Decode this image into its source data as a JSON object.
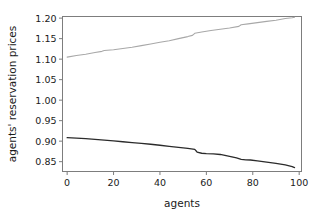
{
  "chart_data": {
    "type": "line",
    "title": "",
    "subtitle": "",
    "xlabel": "agents",
    "ylabel": "agents' reservation prices",
    "xlim": [
      -2,
      101
    ],
    "ylim": [
      0.826,
      1.204
    ],
    "grid": false,
    "legend": "none",
    "xticks": [
      0,
      20,
      40,
      60,
      80,
      100
    ],
    "xtick_labels": [
      "0",
      "20",
      "40",
      "60",
      "80",
      "100"
    ],
    "yticks": [
      0.85,
      0.9,
      0.95,
      1.0,
      1.05,
      1.1,
      1.15,
      1.2
    ],
    "ytick_labels": [
      "0.85",
      "0.90",
      "0.95",
      "1.00",
      "1.05",
      "1.10",
      "1.15",
      "1.20"
    ],
    "series": [
      {
        "name": "sellers",
        "color": "#a8a8a8",
        "x": [
          0,
          4,
          8,
          12,
          15,
          16,
          20,
          24,
          28,
          32,
          36,
          40,
          44,
          48,
          52,
          54,
          55,
          58,
          62,
          66,
          70,
          74,
          75,
          78,
          82,
          86,
          90,
          94,
          97,
          98
        ],
        "values": [
          1.105,
          1.109,
          1.112,
          1.116,
          1.119,
          1.121,
          1.123,
          1.126,
          1.129,
          1.133,
          1.137,
          1.141,
          1.145,
          1.15,
          1.155,
          1.158,
          1.163,
          1.166,
          1.17,
          1.173,
          1.176,
          1.18,
          1.184,
          1.186,
          1.189,
          1.192,
          1.195,
          1.199,
          1.201,
          1.202
        ]
      },
      {
        "name": "buyers",
        "color": "#2b2b2b",
        "x": [
          0,
          4,
          8,
          12,
          16,
          20,
          24,
          28,
          32,
          36,
          40,
          44,
          48,
          52,
          55,
          56,
          58,
          60,
          63,
          66,
          70,
          73,
          75,
          77,
          79,
          82,
          86,
          90,
          94,
          97,
          98
        ],
        "values": [
          0.9085,
          0.9075,
          0.906,
          0.9045,
          0.9025,
          0.9005,
          0.8985,
          0.8965,
          0.8945,
          0.8925,
          0.89,
          0.8875,
          0.885,
          0.8825,
          0.88,
          0.8735,
          0.8705,
          0.8695,
          0.869,
          0.8675,
          0.863,
          0.859,
          0.8555,
          0.8545,
          0.854,
          0.852,
          0.849,
          0.846,
          0.842,
          0.838,
          0.8355
        ]
      }
    ]
  },
  "axes": {
    "xlabel": "agents",
    "ylabel": "agents' reservation prices"
  }
}
